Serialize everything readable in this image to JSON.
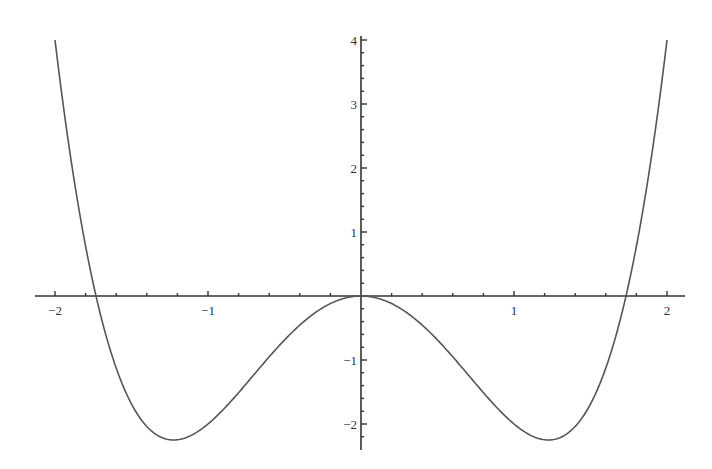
{
  "chart_data": {
    "type": "line",
    "title": "",
    "xlabel": "",
    "ylabel": "",
    "function": "x^4 - 3x^2",
    "xlim": [
      -2,
      2
    ],
    "ylim": [
      -2.3,
      4
    ],
    "grid": false,
    "legend": null,
    "x_ticks": [
      {
        "value": -2,
        "label": "−2"
      },
      {
        "value": -1,
        "label": "−1"
      },
      {
        "value": 1,
        "label": "1"
      },
      {
        "value": 2,
        "label": "2"
      }
    ],
    "y_ticks": [
      {
        "value": 4,
        "label": "4"
      },
      {
        "value": 3,
        "label": "3"
      },
      {
        "value": 2,
        "label": "2"
      },
      {
        "value": 1,
        "label": "1"
      },
      {
        "value": -1,
        "label": "−1"
      },
      {
        "value": -2,
        "label": "−2"
      }
    ],
    "series": [
      {
        "name": "f(x)",
        "color": "#555555",
        "x": [
          -2.0,
          -1.9,
          -1.8,
          -1.732,
          -1.6,
          -1.5,
          -1.4,
          -1.3,
          -1.225,
          -1.1,
          -1.0,
          -0.8,
          -0.6,
          -0.4,
          -0.2,
          0.0,
          0.2,
          0.4,
          0.6,
          0.8,
          1.0,
          1.1,
          1.225,
          1.3,
          1.4,
          1.5,
          1.6,
          1.732,
          1.8,
          1.9,
          2.0
        ],
        "y": [
          4.0,
          2.2,
          0.78,
          0.0,
          -1.13,
          -1.69,
          -2.04,
          -2.2,
          -2.25,
          -2.17,
          -2.0,
          -1.51,
          -0.95,
          -0.45,
          -0.12,
          0.0,
          -0.12,
          -0.45,
          -0.95,
          -1.51,
          -2.0,
          -2.17,
          -2.25,
          -2.2,
          -2.04,
          -1.69,
          -1.13,
          0.0,
          0.78,
          2.2,
          4.0
        ]
      }
    ],
    "key_points": {
      "roots": [
        -1.732,
        0,
        1.732
      ],
      "local_max": {
        "x": 0,
        "y": 0
      },
      "local_minima": [
        {
          "x": -1.225,
          "y": -2.25
        },
        {
          "x": 1.225,
          "y": -2.25
        }
      ]
    }
  },
  "layout": {
    "origin_px": {
      "x": 361,
      "y": 296
    },
    "px_per_unit_x": 153,
    "px_per_unit_y": 64,
    "x_axis_px": [
      35,
      685
    ],
    "y_axis_px": [
      36,
      450
    ],
    "minor_ticks_per_unit_x": 5,
    "minor_ticks_per_unit_y": 5
  }
}
